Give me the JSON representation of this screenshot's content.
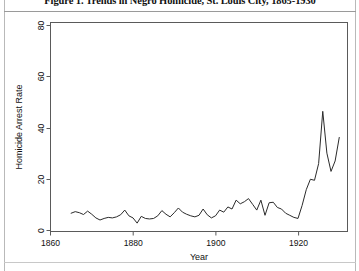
{
  "figure": {
    "caption": "Figure 1. Trends in Negro Homicide, St. Louis City, 1865-1930"
  },
  "axes": {
    "x_title": "Year",
    "y_title": "Homicide Arrest Rate",
    "x_ticks": [
      "1860",
      "1880",
      "1900",
      "1920"
    ],
    "y_ticks": [
      "0",
      "20",
      "40",
      "60",
      "80"
    ]
  },
  "chart_data": {
    "type": "line",
    "title": "Figure 1. Trends in Negro Homicide, St. Louis City, 1865-1930",
    "xlabel": "Year",
    "ylabel": "Homicide Arrest Rate",
    "xlim": [
      1860,
      1932
    ],
    "ylim": [
      0,
      80
    ],
    "grid": false,
    "legend": "none",
    "x_ticks": [
      1860,
      1880,
      1900,
      1920
    ],
    "y_ticks": [
      0,
      20,
      40,
      60,
      80
    ],
    "series": [
      {
        "name": "Homicide Arrest Rate",
        "x": [
          1865,
          1866,
          1867,
          1868,
          1869,
          1870,
          1871,
          1872,
          1873,
          1874,
          1875,
          1876,
          1877,
          1878,
          1879,
          1880,
          1881,
          1882,
          1883,
          1884,
          1885,
          1886,
          1887,
          1888,
          1889,
          1890,
          1891,
          1892,
          1893,
          1894,
          1895,
          1896,
          1897,
          1898,
          1899,
          1900,
          1901,
          1902,
          1903,
          1904,
          1905,
          1906,
          1907,
          1908,
          1909,
          1910,
          1911,
          1912,
          1913,
          1914,
          1915,
          1916,
          1917,
          1918,
          1919,
          1920,
          1921,
          1922,
          1923,
          1924,
          1925,
          1926,
          1927,
          1928,
          1929,
          1930
        ],
        "y": [
          7.0,
          7.6,
          7.2,
          6.5,
          7.8,
          6.6,
          5.2,
          4.4,
          5.0,
          5.4,
          5.2,
          5.6,
          6.4,
          8.2,
          6.0,
          5.2,
          3.2,
          5.8,
          5.0,
          4.8,
          5.0,
          6.0,
          8.0,
          6.6,
          5.6,
          7.2,
          9.0,
          7.4,
          6.6,
          6.0,
          5.6,
          6.2,
          8.6,
          6.4,
          5.2,
          6.0,
          8.2,
          7.4,
          9.4,
          8.6,
          12.0,
          10.6,
          11.4,
          12.6,
          10.4,
          8.2,
          12.0,
          6.2,
          11.0,
          11.2,
          9.2,
          8.6,
          7.0,
          6.2,
          5.4,
          5.0,
          10.0,
          16.0,
          20.0,
          19.6,
          26.0,
          46.0,
          30.0,
          23.0,
          27.0,
          36.0
        ]
      }
    ]
  }
}
